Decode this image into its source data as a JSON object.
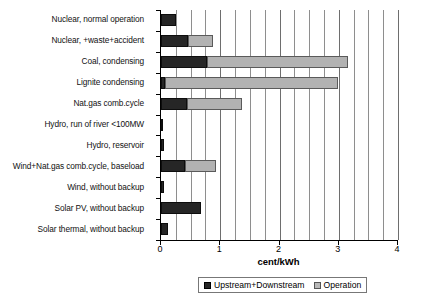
{
  "chart_data": {
    "type": "bar",
    "orientation": "horizontal",
    "stacked": true,
    "title": "",
    "xlabel": "cent/kWh",
    "ylabel": "",
    "xlim": [
      0,
      4
    ],
    "xticks": [
      0,
      1,
      2,
      3,
      4
    ],
    "xtick_labels": [
      "0",
      "1",
      "2",
      "3",
      "4"
    ],
    "grid": "vertical",
    "gridline_interval": 0.25,
    "legend_position": "bottom",
    "categories": [
      "Nuclear, normal operation",
      "Nuclear, +waste+accident",
      "Coal, condensing",
      "Lignite condensing",
      "Nat.gas comb.cycle",
      "Hydro, run of river <100MW",
      "Hydro, reservoir",
      "Wind+Nat.gas comb.cycle, baseload",
      "Wind, without backup",
      "Solar PV, without backup",
      "Solar thermal, without backup"
    ],
    "series": [
      {
        "name": "Upstream+Downstream",
        "color": "#262626",
        "values": [
          0.25,
          0.45,
          0.78,
          0.07,
          0.44,
          0.04,
          0.05,
          0.4,
          0.05,
          0.68,
          0.12
        ]
      },
      {
        "name": "Operation",
        "color": "#b2b2b2",
        "values": [
          0.0,
          0.43,
          2.37,
          2.91,
          0.93,
          0.0,
          0.0,
          0.53,
          0.0,
          0.0,
          0.0
        ]
      }
    ],
    "totals": [
      0.25,
      0.88,
      3.15,
      2.98,
      1.37,
      0.04,
      0.05,
      0.93,
      0.05,
      0.68,
      0.12
    ]
  },
  "legend": {
    "items": [
      {
        "label": "Upstream+Downstream",
        "swatch": "dark"
      },
      {
        "label": "Operation",
        "swatch": "light"
      }
    ]
  },
  "colors": {
    "upstream": "#262626",
    "operation": "#b2b2b2",
    "gridline": "#8e8e8e",
    "axis": "#000000",
    "background": "#ffffff"
  }
}
